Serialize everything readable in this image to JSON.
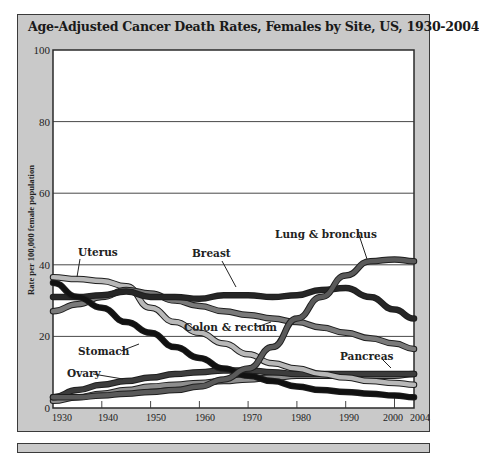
{
  "chart_data": {
    "type": "line",
    "title": "Age-Adjusted Cancer Death Rates, Females by Site, US, 1930-2004",
    "xlabel": "",
    "ylabel": "Rate per 100,000 female population",
    "xlim": [
      1930,
      2004
    ],
    "ylim": [
      0,
      100
    ],
    "x_ticks": [
      1930,
      1940,
      1950,
      1960,
      1970,
      1980,
      1990,
      2000,
      2004
    ],
    "y_ticks": [
      0,
      20,
      40,
      60,
      80,
      100
    ],
    "grid": "horizontal",
    "x": [
      1930,
      1935,
      1940,
      1945,
      1950,
      1955,
      1960,
      1965,
      1970,
      1975,
      1980,
      1985,
      1990,
      1995,
      2000,
      2004
    ],
    "series": [
      {
        "name": "Lung & bronchus",
        "color": "#5a5a5a",
        "values": [
          3,
          3,
          3.5,
          4,
          4.5,
          5,
          6,
          8,
          11,
          17,
          25,
          31,
          37,
          41,
          41.5,
          41
        ]
      },
      {
        "name": "Breast",
        "color": "#262626",
        "values": [
          31,
          31,
          31.5,
          32.5,
          31,
          31,
          30.5,
          31.5,
          31.5,
          31,
          31.5,
          33,
          33.5,
          31,
          27.5,
          25
        ]
      },
      {
        "name": "Colon & rectum",
        "color": "#7a7a7a",
        "values": [
          27,
          29,
          31,
          33,
          32,
          30,
          28.5,
          27,
          26,
          25,
          24,
          22.5,
          21,
          19.5,
          18,
          16.5
        ]
      },
      {
        "name": "Uterus",
        "color": "#b8b8b8",
        "values": [
          36.5,
          36,
          35.5,
          34,
          28,
          24,
          21,
          18,
          15,
          12.5,
          11,
          9.5,
          8.5,
          7.5,
          7,
          6.5
        ]
      },
      {
        "name": "Stomach",
        "color": "#111111",
        "values": [
          35,
          31,
          28,
          24,
          21,
          17,
          14,
          11,
          9,
          7.5,
          6,
          5,
          4.5,
          4,
          3.5,
          3
        ]
      },
      {
        "name": "Ovary",
        "color": "#3c3c3c",
        "values": [
          3,
          5,
          6.5,
          7.5,
          8.5,
          9.5,
          10,
          10.5,
          10.5,
          10,
          9.5,
          9.5,
          9.5,
          9.5,
          9.5,
          9.5
        ]
      },
      {
        "name": "Pancreas",
        "color": "#8e8e8e",
        "values": [
          2,
          3,
          4,
          5,
          6,
          6.5,
          7,
          7.5,
          8,
          8.5,
          9,
          9,
          9,
          9,
          9,
          9.5
        ]
      }
    ],
    "annotations": [
      {
        "text": "Uterus",
        "x": 1934,
        "y": 38
      },
      {
        "text": "Breast",
        "x": 1956,
        "y": 38
      },
      {
        "text": "Lung & bronchus",
        "x": 1982,
        "y": 50
      },
      {
        "text": "Colon & rectum",
        "x": 1961,
        "y": 23
      },
      {
        "text": "Stomach",
        "x": 1935,
        "y": 14
      },
      {
        "text": "Ovary",
        "x": 1933,
        "y": 9
      },
      {
        "text": "Pancreas",
        "x": 1993,
        "y": 13
      }
    ],
    "legend": "inline labels"
  },
  "labels": {
    "title": "Age-Adjusted Cancer Death Rates, Females by Site, US, 1930-2004",
    "ylabel": "Rate per 100,000 female population",
    "y_ticks": [
      "0",
      "20",
      "40",
      "60",
      "80",
      "100"
    ],
    "x_ticks": [
      "1930",
      "1940",
      "1950",
      "1960",
      "1970",
      "1980",
      "1990",
      "2000",
      "2004"
    ],
    "series_labels": {
      "uterus": "Uterus",
      "breast": "Breast",
      "lung": "Lung & bronchus",
      "colon": "Colon & rectum",
      "stomach": "Stomach",
      "ovary": "Ovary",
      "pancreas": "Pancreas"
    }
  }
}
